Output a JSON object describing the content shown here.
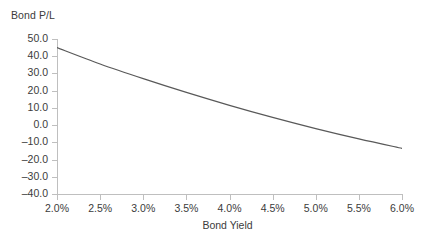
{
  "chart_data": {
    "type": "line",
    "title": "",
    "xlabel": "Bond Yield",
    "ylabel": "Bond P/L",
    "x": [
      2.0,
      2.5,
      3.0,
      3.5,
      4.0,
      4.5,
      5.0,
      5.5,
      6.0
    ],
    "x_tick_labels": [
      "2.0%",
      "2.5%",
      "3.0%",
      "3.5%",
      "4.0%",
      "4.5%",
      "5.0%",
      "5.5%",
      "6.0%"
    ],
    "xlim": [
      2.0,
      6.0
    ],
    "y_tick_values": [
      50.0,
      40.0,
      30.0,
      20.0,
      10.0,
      0.0,
      -10.0,
      -20.0,
      -30.0,
      -40.0
    ],
    "y_tick_labels": [
      "50.0",
      "40.0",
      "30.0",
      "20.0",
      "10.0",
      "0.0",
      "–10.0",
      "–20.0",
      "–30.0",
      "–40.0"
    ],
    "ylim": [
      -40.0,
      50.0
    ],
    "grid": false,
    "legend": null,
    "series": [
      {
        "name": "Bond P/L",
        "color": "#595959",
        "values": [
          45.0,
          35.5,
          27.0,
          19.0,
          11.5,
          4.5,
          -2.0,
          -8.0,
          -13.5
        ],
        "dense_x": [
          2.0,
          2.2,
          2.4,
          2.6,
          2.8,
          3.0,
          3.2,
          3.4,
          3.6,
          3.8,
          4.0,
          4.2,
          4.4,
          4.6,
          4.8,
          5.0,
          5.2,
          5.4,
          5.6,
          5.8,
          6.0
        ],
        "dense_y": [
          45.0,
          41.2,
          37.5,
          34.0,
          30.5,
          27.2,
          24.0,
          20.9,
          17.9,
          15.0,
          12.2,
          9.5,
          6.9,
          4.4,
          2.0,
          -0.4,
          -2.6,
          -4.8,
          -6.9,
          -8.9,
          -10.9
        ]
      }
    ]
  },
  "axis": {
    "y_title": "Bond P/L",
    "x_title": "Bond Yield"
  }
}
